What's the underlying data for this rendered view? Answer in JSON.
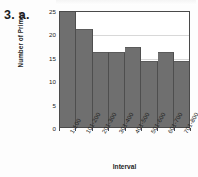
{
  "problem": {
    "label": "3. a."
  },
  "chart_data": {
    "type": "bar",
    "title": "",
    "subtitle": "",
    "xlabel": "Interval",
    "ylabel": "Number of Primes",
    "categories": [
      "1-100",
      "101-200",
      "201-300",
      "301-400",
      "401-500",
      "501-600",
      "601-700",
      "701-800"
    ],
    "values": [
      25,
      21,
      16,
      16,
      17,
      14,
      16,
      14
    ],
    "ylim": [
      0,
      25
    ],
    "yticks": [
      0,
      5,
      10,
      15,
      20,
      25
    ],
    "ytick_labels": [
      "0",
      "5",
      "10",
      "15",
      "20",
      "25"
    ],
    "grid": true,
    "grid_axis": "y",
    "legend": false,
    "legend_position": "none",
    "bar_color": "#6f6f6f",
    "bar_edge_color": "#4e4e4e",
    "axis_color": "#4a4a4a",
    "gridline_color": "#d8d8d8",
    "background_color": "#ffffff",
    "xtick_label_rotation": -60
  }
}
